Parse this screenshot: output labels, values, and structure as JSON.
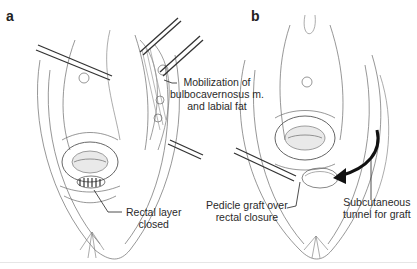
{
  "figure": {
    "panels": [
      {
        "letter": "a",
        "labels": [
          {
            "id": "mobilization",
            "lines": [
              "Mobilization of",
              "bulbocavernosus m.",
              "and labial fat"
            ]
          },
          {
            "id": "rectal",
            "lines": [
              "Rectal layer",
              "closed"
            ]
          }
        ]
      },
      {
        "letter": "b",
        "labels": [
          {
            "id": "pedicle",
            "lines": [
              "Pedicle graft over",
              "rectal closure"
            ]
          },
          {
            "id": "tunnel",
            "lines": [
              "Subcutaneous",
              "tunnel for graft"
            ]
          }
        ]
      }
    ],
    "colors": {
      "line": "#555555",
      "shade": "#bdbdbd",
      "instrument": "#333333",
      "text": "#2a2a2a"
    }
  }
}
